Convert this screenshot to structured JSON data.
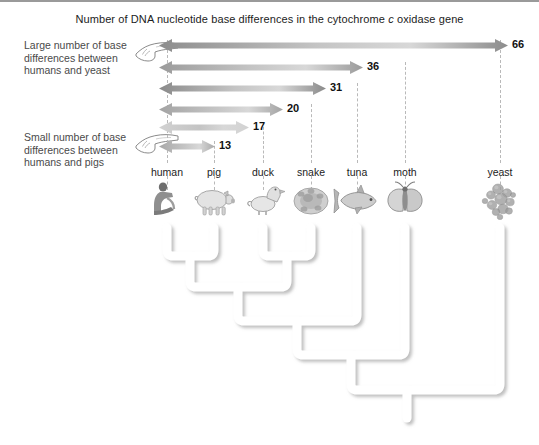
{
  "figure": {
    "title_prefix": "Number of DNA nucleotide base differences in the cytochrome ",
    "title_italic": "c",
    "title_suffix": " oxidase gene",
    "type": "cladogram-with-difference-arrows"
  },
  "annotations": [
    {
      "id": "large",
      "text": "Large number of base differences between humans and yeast",
      "icon": "pointing-hand-icon"
    },
    {
      "id": "small",
      "text": "Small number of base differences between humans and pigs",
      "icon": "pointing-hand-icon"
    }
  ],
  "chart_data": {
    "type": "bar",
    "title": "Number of DNA nucleotide base differences in the cytochrome c oxidase gene",
    "xlabel": "",
    "ylabel": "",
    "orientation": "horizontal",
    "reference_taxon": "human",
    "categories": [
      "yeast",
      "moth",
      "tuna",
      "snake",
      "duck",
      "pig"
    ],
    "values": [
      66,
      36,
      31,
      20,
      17,
      13
    ],
    "labels": [
      "66",
      "36",
      "31",
      "20",
      "17",
      "13"
    ],
    "grid": false,
    "legend": "none"
  },
  "taxa": [
    {
      "name": "human",
      "label": "human",
      "x": 167,
      "organism_icon": "human-sitting-icon"
    },
    {
      "name": "pig",
      "label": "pig",
      "x": 214,
      "organism_icon": "pig-icon"
    },
    {
      "name": "duck",
      "label": "duck",
      "x": 263,
      "organism_icon": "duck-icon"
    },
    {
      "name": "snake",
      "label": "snake",
      "x": 311,
      "organism_icon": "snake-coiled-icon"
    },
    {
      "name": "tuna",
      "label": "tuna",
      "x": 357,
      "organism_icon": "tuna-fish-icon"
    },
    {
      "name": "moth",
      "label": "moth",
      "x": 405,
      "organism_icon": "moth-icon"
    },
    {
      "name": "yeast",
      "label": "yeast",
      "x": 500,
      "organism_icon": "yeast-cells-icon"
    }
  ],
  "arrows": [
    {
      "taxon": "yeast",
      "value": "66",
      "y": 45,
      "from_x": 167,
      "to_x": 500,
      "shade": "#8c8c8c"
    },
    {
      "taxon": "moth",
      "value": "36",
      "y": 67,
      "from_x": 167,
      "to_x": 355,
      "shade": "#9b9b9b"
    },
    {
      "taxon": "tuna",
      "value": "31",
      "y": 88,
      "from_x": 167,
      "to_x": 318,
      "shade": "#8a8a8a"
    },
    {
      "taxon": "snake",
      "value": "20",
      "y": 109,
      "from_x": 167,
      "to_x": 275,
      "shade": "#a3a3a3"
    },
    {
      "taxon": "duck",
      "value": "17",
      "y": 127,
      "from_x": 167,
      "to_x": 241,
      "shade": "#d2d2d2"
    },
    {
      "taxon": "pig",
      "value": "13",
      "y": 146,
      "from_x": 167,
      "to_x": 207,
      "shade": "#a8a8a8"
    }
  ],
  "tree": {
    "description": "Nested cladogram joining human+pig, then duck+snake, then tuna, moth and yeast",
    "nodes": [
      "human-pig",
      "duck-snake",
      "human-pig-duck-snake",
      "plus-tuna",
      "plus-moth",
      "plus-yeast"
    ]
  },
  "colors": {
    "background": "#ffffff",
    "text": "#1c1c1c",
    "note_text": "#4a4a4a",
    "dash": "#b9b9b9",
    "tree_branch": "#ffffff",
    "tree_shadow": "#c9c9c9",
    "border": "#9a9a9a"
  }
}
